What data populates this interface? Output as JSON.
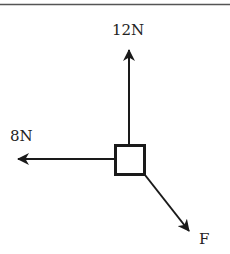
{
  "diagram": {
    "type": "free-body-diagram",
    "object": "box",
    "forces": [
      {
        "label": "12N",
        "direction": "up"
      },
      {
        "label": "8N",
        "direction": "left"
      },
      {
        "label": "F",
        "direction": "down-right"
      }
    ]
  },
  "labels": {
    "up_force": "12N",
    "left_force": "8N",
    "diagonal_force": "F"
  },
  "colors": {
    "stroke": "#1a1a1a",
    "rule": "#555555",
    "background": "#ffffff"
  }
}
